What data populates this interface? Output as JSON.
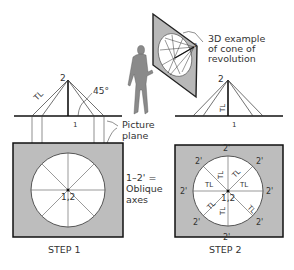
{
  "annotations": {
    "example_3d": [
      "3D example",
      "of cone of",
      "revolution"
    ],
    "picture_plane": [
      "Picture",
      "plane"
    ],
    "oblique_axes": [
      "1–2' =",
      "Oblique",
      "axes"
    ],
    "angle": "45°"
  },
  "step1": {
    "caption": "STEP 1",
    "apex_label": "2",
    "base_label": "1",
    "tl_label": "TL",
    "center_label": "1,2"
  },
  "step2": {
    "caption": "STEP 2",
    "apex_label": "2",
    "base_label": "1",
    "tl_label": "TL",
    "center_label": "1,2",
    "point_label": "2'",
    "sector_label": "TL"
  },
  "colors": {
    "plane_fill": "#bdbdbd",
    "line": "#222222",
    "circle_fill": "#ffffff"
  }
}
